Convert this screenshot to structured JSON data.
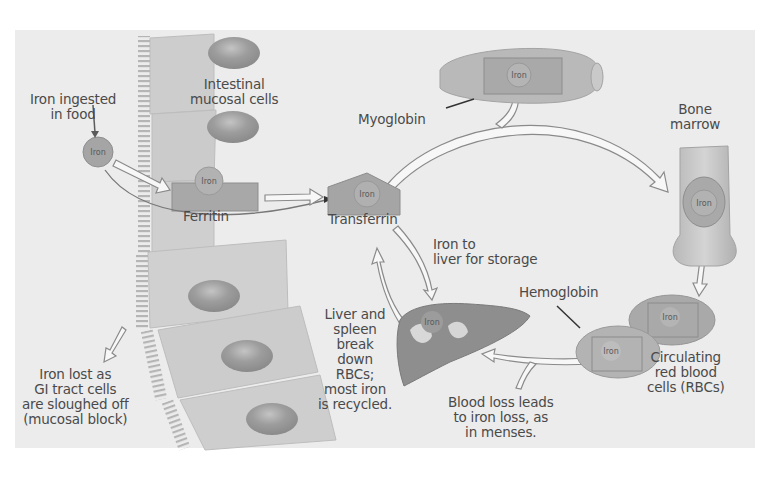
{
  "diagram": {
    "colors": {
      "background": "#ffffff",
      "panel": "#ececec",
      "cell": "#cfcfcf",
      "nucleus": "#9a9a9a",
      "organ": "#8c8c8c",
      "arrow_fill": "#f7f7f7",
      "text": "#4a4a4a"
    },
    "labels": {
      "iron_ingested": [
        "Iron ingested",
        "in food"
      ],
      "intestinal_cells": [
        "Intestinal",
        "mucosal cells"
      ],
      "ferritin": "Ferritin",
      "transferrin": "Transferrin",
      "myoglobin": "Myoglobin",
      "bone_marrow": [
        "Bone",
        "marrow"
      ],
      "iron_to_liver": [
        "Iron to",
        "liver for storage"
      ],
      "hemoglobin": "Hemoglobin",
      "circulating_rbcs": [
        "Circulating",
        "red blood",
        "cells (RBCs)"
      ],
      "liver_spleen": [
        "Liver and",
        "spleen",
        "break",
        "down",
        "RBCs;",
        "most iron",
        "is recycled."
      ],
      "blood_loss": [
        "Blood loss leads",
        "to iron loss, as",
        "in menses."
      ],
      "iron_lost": [
        "Iron lost as",
        "GI tract cells",
        "are sloughed off",
        "(mucosal block)"
      ]
    },
    "iron_tag": "Iron",
    "nodes": [
      {
        "id": "food-iron",
        "label": "Iron ingested in food"
      },
      {
        "id": "intestinal-mucosal-cells",
        "label": "Intestinal mucosal cells"
      },
      {
        "id": "ferritin",
        "label": "Ferritin"
      },
      {
        "id": "transferrin",
        "label": "Transferrin"
      },
      {
        "id": "myoglobin",
        "label": "Myoglobin"
      },
      {
        "id": "bone-marrow",
        "label": "Bone marrow"
      },
      {
        "id": "rbcs",
        "label": "Circulating red blood cells (RBCs)"
      },
      {
        "id": "liver",
        "label": "Liver and spleen"
      }
    ],
    "edges": [
      {
        "from": "food-iron",
        "to": "ferritin"
      },
      {
        "from": "food-iron",
        "to": "transferrin"
      },
      {
        "from": "ferritin",
        "to": "transferrin"
      },
      {
        "from": "transferrin",
        "to": "myoglobin"
      },
      {
        "from": "transferrin",
        "to": "bone-marrow"
      },
      {
        "from": "transferrin",
        "to": "liver",
        "label": "Iron to liver for storage"
      },
      {
        "from": "bone-marrow",
        "to": "rbcs"
      },
      {
        "from": "rbcs",
        "to": "liver"
      },
      {
        "from": "rbcs",
        "to": "blood-loss",
        "label": "Blood loss leads to iron loss, as in menses."
      },
      {
        "from": "liver",
        "to": "transferrin"
      },
      {
        "from": "intestinal-mucosal-cells",
        "to": "sloughed",
        "label": "Iron lost as GI tract cells are sloughed off (mucosal block)"
      }
    ]
  }
}
